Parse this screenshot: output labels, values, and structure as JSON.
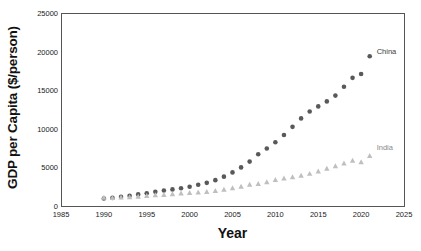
{
  "chart_data": {
    "type": "scatter",
    "title": "",
    "xlabel": "Year",
    "ylabel": "GDP per Capita ($/person)",
    "xlim": [
      1985,
      2025
    ],
    "ylim": [
      0,
      25000
    ],
    "xticks": [
      1985,
      1990,
      1995,
      2000,
      2005,
      2010,
      2015,
      2020,
      2025
    ],
    "yticks": [
      0,
      5000,
      10000,
      15000,
      20000,
      25000
    ],
    "grid": false,
    "legend_position": "inline-end-of-series",
    "x": [
      1990,
      1991,
      1992,
      1993,
      1994,
      1995,
      1996,
      1997,
      1998,
      1999,
      2000,
      2001,
      2002,
      2003,
      2004,
      2005,
      2006,
      2007,
      2008,
      2009,
      2010,
      2011,
      2012,
      2013,
      2014,
      2015,
      2016,
      2017,
      2018,
      2019,
      2020,
      2021
    ],
    "series": [
      {
        "name": "China",
        "marker": "circle",
        "color": "#595959",
        "label": "China",
        "values": [
          980,
          1050,
          1180,
          1320,
          1500,
          1650,
          1830,
          2000,
          2150,
          2300,
          2500,
          2750,
          3000,
          3350,
          3800,
          4350,
          5000,
          5750,
          6700,
          7450,
          8250,
          9200,
          10250,
          11350,
          12250,
          12900,
          13550,
          14300,
          15450,
          16600,
          17100,
          19400
        ]
      },
      {
        "name": "India",
        "marker": "triangle",
        "color": "#bfbfbf",
        "label": "India",
        "values": [
          1100,
          1090,
          1130,
          1180,
          1250,
          1330,
          1420,
          1470,
          1550,
          1660,
          1720,
          1790,
          1850,
          1980,
          2150,
          2330,
          2540,
          2780,
          2880,
          3100,
          3400,
          3600,
          3750,
          3950,
          4200,
          4500,
          4850,
          5200,
          5550,
          5900,
          5700,
          6500
        ]
      }
    ]
  },
  "axis": {
    "y_ticks": [
      "0",
      "5000",
      "10000",
      "15000",
      "20000",
      "25000"
    ],
    "x_ticks": [
      "1985",
      "1990",
      "1995",
      "2000",
      "2005",
      "2010",
      "2015",
      "2020",
      "2025"
    ]
  },
  "labels": {
    "x_title": "Year",
    "y_title": "GDP per Capita ($/person)",
    "china": "China",
    "india": "India"
  },
  "colors": {
    "china": "#595959",
    "india": "#bfbfbf",
    "axis": "#555555",
    "text": "#1a1a1a",
    "background": "#ffffff"
  }
}
